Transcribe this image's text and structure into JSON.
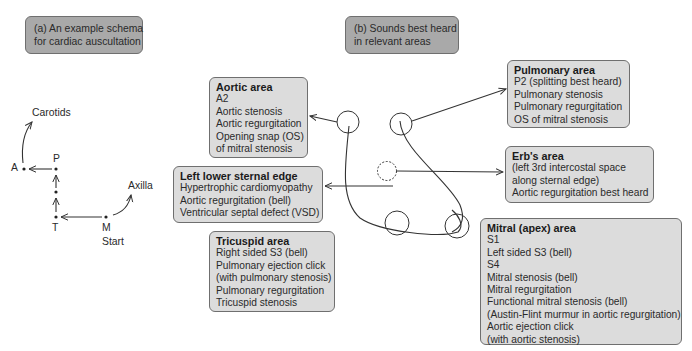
{
  "panel_a": {
    "header": [
      "(a) An example schema",
      "for cardiac auscultation"
    ],
    "labels": {
      "carotids": "Carotids",
      "a": "A",
      "p": "P",
      "t": "T",
      "m": "M",
      "start": "Start",
      "axilla": "Axilla"
    }
  },
  "panel_b": {
    "header": [
      "(b) Sounds best heard",
      "in relevant areas"
    ],
    "areas": {
      "aortic": {
        "title": "Aortic area",
        "items": [
          "A2",
          "Aortic stenosis",
          "Aortic regurgitation",
          "Opening snap (OS)",
          "of mitral stenosis"
        ]
      },
      "left_lower_sternal_edge": {
        "title": "Left lower sternal edge",
        "items": [
          "Hypertrophic cardiomyopathy",
          "Aortic regurgitation (bell)",
          "Ventricular septal defect (VSD)"
        ]
      },
      "tricuspid": {
        "title": "Tricuspid area",
        "items": [
          "Right sided S3 (bell)",
          "Pulmonary ejection click",
          "(with pulmonary stenosis)",
          "Pulmonary regurgitation",
          "Tricuspid stenosis"
        ]
      },
      "pulmonary": {
        "title": "Pulmonary area",
        "items": [
          "P2 (splitting best heard)",
          "Pulmonary stenosis",
          "Pulmonary regurgitation",
          "OS of mitral stenosis"
        ]
      },
      "erbs": {
        "title": "Erb's area",
        "items": [
          "(left 3rd intercostal space",
          "along sternal edge)",
          "Aortic regurgitation best heard"
        ]
      },
      "mitral": {
        "title": "Mitral (apex) area",
        "items": [
          "S1",
          "Left sided S3 (bell)",
          "S4",
          "Mitral stenosis (bell)",
          "Mitral regurgitation",
          "Functional mitral stenosis (bell)",
          "(Austin-Flint murmur in aortic regurgitation)",
          "Aortic ejection click",
          "(with aortic stenosis)"
        ]
      }
    }
  },
  "colors": {
    "header_box": "#a9a9a9",
    "area_box": "#dcdcdc",
    "border": "#6f6f6f",
    "line": "#333333"
  }
}
